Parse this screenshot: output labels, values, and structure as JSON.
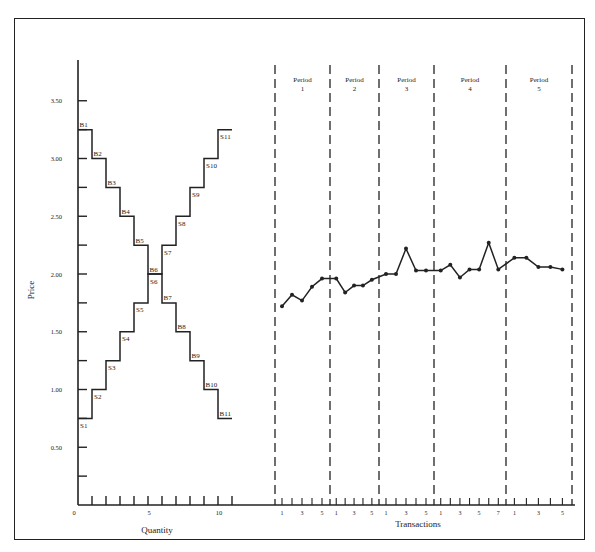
{
  "chart_data": [
    {
      "type": "line",
      "subtype": "step",
      "title": "",
      "xlabel": "Quantity",
      "ylabel": "Price",
      "xlim": [
        0,
        11
      ],
      "ylim": [
        0,
        3.75
      ],
      "x_ticks": [
        0,
        5,
        10
      ],
      "x_tick_labels": [
        "0",
        "5",
        "10"
      ],
      "y_ticks": [
        0,
        0.25,
        0.5,
        0.75,
        1.0,
        1.25,
        1.5,
        1.75,
        2.0,
        2.25,
        2.5,
        2.75,
        3.0,
        3.25,
        3.5
      ],
      "y_tick_labels": [
        "0",
        "",
        "0.50",
        "",
        "1.00",
        "",
        "1.50",
        "",
        "2.00",
        "",
        "2.50",
        "",
        "3.00",
        "",
        "3.50"
      ],
      "grid": false,
      "series": [
        {
          "name": "Demand (buyers)",
          "labels": [
            "B1",
            "B2",
            "B3",
            "B4",
            "B5",
            "B6",
            "B7",
            "B8",
            "B9",
            "B10",
            "B11"
          ],
          "values": [
            3.25,
            3.0,
            2.75,
            2.5,
            2.25,
            2.0,
            1.75,
            1.5,
            1.25,
            1.0,
            0.75
          ]
        },
        {
          "name": "Supply (sellers)",
          "labels": [
            "S1",
            "S2",
            "S3",
            "S4",
            "S5",
            "S6",
            "S7",
            "S8",
            "S9",
            "S10",
            "S11"
          ],
          "values": [
            0.75,
            1.0,
            1.25,
            1.5,
            1.75,
            2.0,
            2.25,
            2.5,
            2.75,
            3.0,
            3.25
          ]
        }
      ]
    },
    {
      "type": "line",
      "title": "",
      "xlabel": "Transactions",
      "ylabel": "Price",
      "ylim": [
        0,
        3.75
      ],
      "grid": false,
      "periods": [
        {
          "label": "Period",
          "number": "1",
          "tick_labels": [
            "1",
            "3",
            "5"
          ],
          "prices": [
            1.72,
            1.82,
            1.77,
            1.89,
            1.96
          ]
        },
        {
          "label": "Period",
          "number": "2",
          "tick_labels": [
            "1",
            "3",
            "5"
          ],
          "prices": [
            1.96,
            1.84,
            1.9,
            1.9,
            1.95
          ]
        },
        {
          "label": "Period",
          "number": "3",
          "tick_labels": [
            "1",
            "3",
            "5"
          ],
          "prices": [
            2.0,
            2.0,
            2.22,
            2.03,
            2.03
          ]
        },
        {
          "label": "Period",
          "number": "4",
          "tick_labels": [
            "1",
            "3",
            "5",
            "7"
          ],
          "prices": [
            2.03,
            2.08,
            1.97,
            2.04,
            2.04,
            2.27,
            2.04
          ]
        },
        {
          "label": "Period",
          "number": "5",
          "tick_labels": [
            "1",
            "3",
            "5"
          ],
          "prices": [
            2.14,
            2.14,
            2.06,
            2.06,
            2.04
          ]
        }
      ]
    }
  ],
  "labels": {
    "price_axis": "Price",
    "quantity_axis": "Quantity",
    "transactions_axis": "Transactions"
  },
  "colors": {
    "ink": "#222222",
    "background": "#ffffff"
  }
}
